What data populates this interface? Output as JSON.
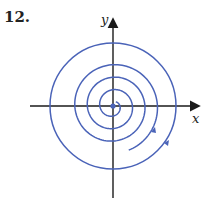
{
  "problem_number": "12.",
  "axes": {
    "x_label": "x",
    "y_label": "y"
  },
  "colors": {
    "curve": "#4a63b8",
    "axis": "#1a1a1a"
  },
  "diagram": {
    "type": "phase-portrait",
    "curves": [
      {
        "name": "outer-circle",
        "direction": "clockwise"
      },
      {
        "name": "inner-spiral",
        "direction": "clockwise-outward"
      }
    ],
    "equilibrium": "origin"
  }
}
